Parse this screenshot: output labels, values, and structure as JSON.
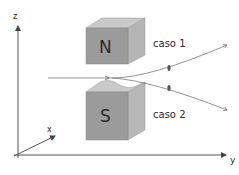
{
  "diagram": {
    "axes": {
      "z_label": "z",
      "x_label": "x",
      "y_label": "y"
    },
    "magnets": [
      {
        "pole": "N",
        "position": "top"
      },
      {
        "pole": "S",
        "position": "bottom"
      }
    ],
    "cases": [
      {
        "label": "caso 1"
      },
      {
        "label": "caso 2"
      }
    ],
    "colors": {
      "magnet_front": "#9a9a9a",
      "magnet_top": "#c8c8c8",
      "magnet_side": "#b4b4b4",
      "lines": "#555555",
      "background": "#ffffff"
    }
  }
}
